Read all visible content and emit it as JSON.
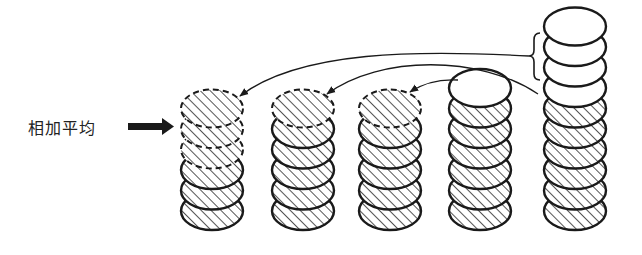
{
  "diagram": {
    "label": "相加平均",
    "label_arrow": "thick-right-arrow",
    "colors": {
      "ink": "#1a1a1a",
      "hatch": "#2a2a2a",
      "background": "#ffffff",
      "white_disc": "#ffffff"
    },
    "stacks": [
      {
        "id": 1,
        "cx": 212,
        "solid_hatched": 3,
        "dashed_hatched": 3,
        "white": 0
      },
      {
        "id": 2,
        "cx": 303,
        "solid_hatched": 5,
        "dashed_hatched": 1,
        "white": 0
      },
      {
        "id": 3,
        "cx": 390,
        "solid_hatched": 5,
        "dashed_hatched": 1,
        "white": 0
      },
      {
        "id": 4,
        "cx": 480,
        "solid_hatched": 6,
        "dashed_hatched": 0,
        "white": 1
      },
      {
        "id": 5,
        "cx": 575,
        "solid_hatched": 6,
        "dashed_hatched": 0,
        "white": 4
      }
    ],
    "brace": {
      "stack": 5,
      "covers_top_white_discs": 3
    },
    "transfer_arrows": [
      {
        "from": "stack-5-brace",
        "to": "stack-1-top"
      },
      {
        "from": "stack-5-brace",
        "to": "stack-2-top"
      },
      {
        "from": "stack-4-top",
        "to": "stack-3-top"
      }
    ]
  }
}
